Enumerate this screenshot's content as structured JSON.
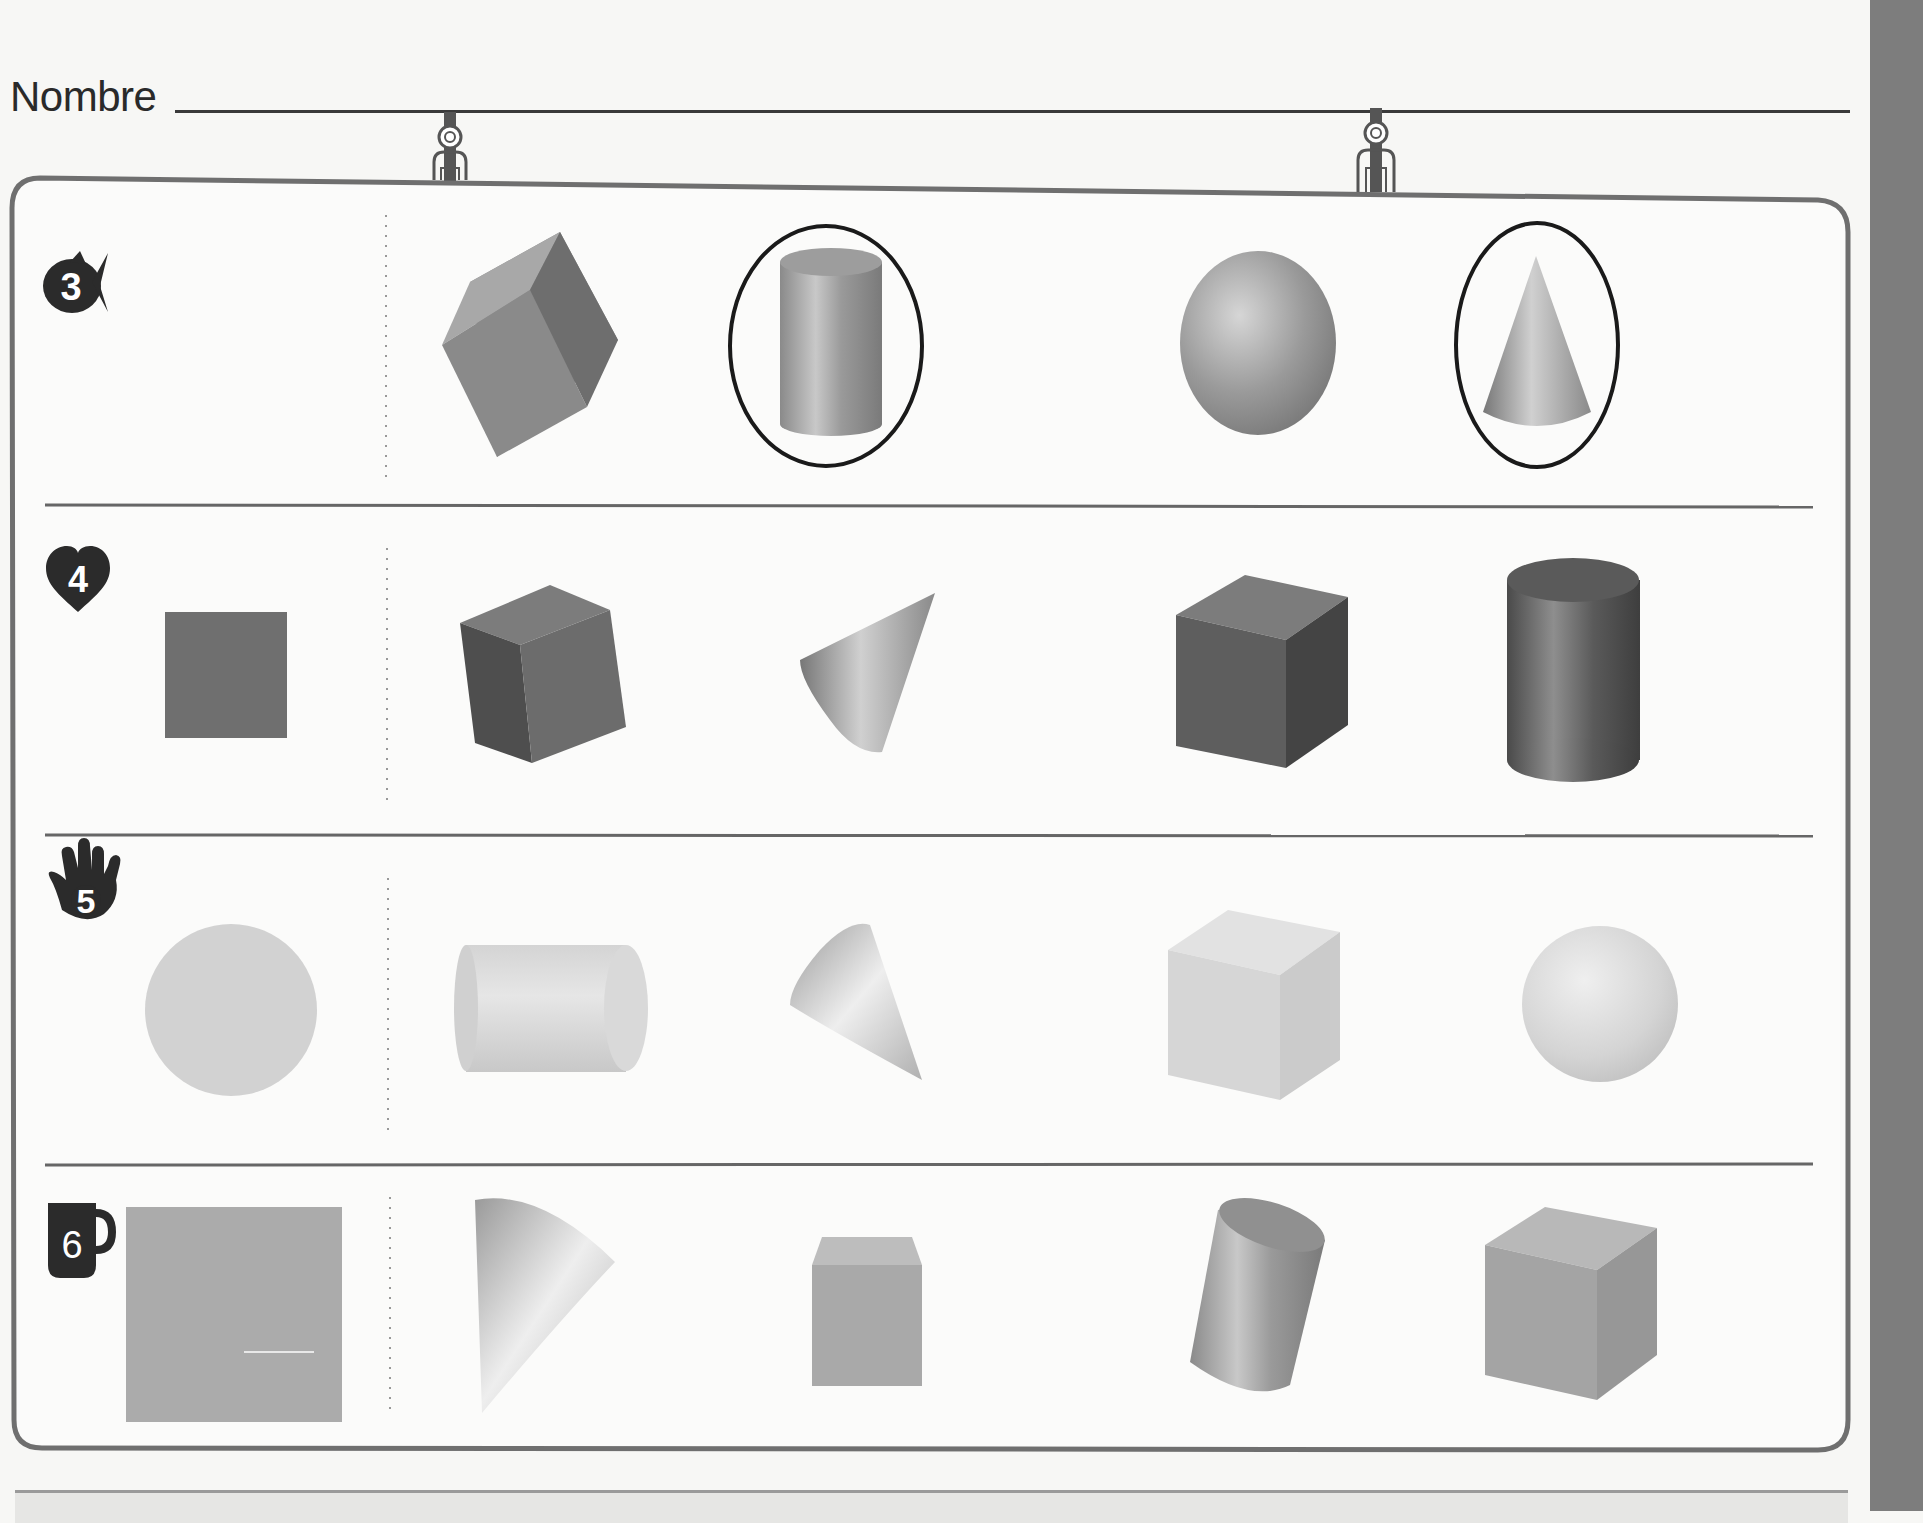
{
  "worksheet": {
    "name_label": "Nombre",
    "name_field_value": "",
    "colors": {
      "frame": "#6f6f6f",
      "divider": "#666666",
      "badge": "#2b2b2b",
      "answer_circle": "#1a1a1a",
      "side_strip": "#7d7d7d",
      "paper": "#f7f7f5"
    },
    "rows": [
      {
        "number": "3",
        "badge_icon": "fish-icon",
        "reference_shape": "none",
        "options": [
          "cube",
          "cylinder",
          "sphere",
          "cone"
        ],
        "circled": [
          "cylinder",
          "cone"
        ]
      },
      {
        "number": "4",
        "badge_icon": "heart-icon",
        "reference_shape": "square",
        "options": [
          "cube",
          "cone",
          "cube",
          "cylinder"
        ],
        "circled": []
      },
      {
        "number": "5",
        "badge_icon": "hand-icon",
        "reference_shape": "circle",
        "options": [
          "cylinder",
          "cone",
          "cube",
          "sphere"
        ],
        "circled": []
      },
      {
        "number": "6",
        "badge_icon": "mug-icon",
        "reference_shape": "square",
        "options": [
          "cone",
          "cube",
          "cylinder",
          "cube"
        ],
        "circled": []
      }
    ]
  }
}
